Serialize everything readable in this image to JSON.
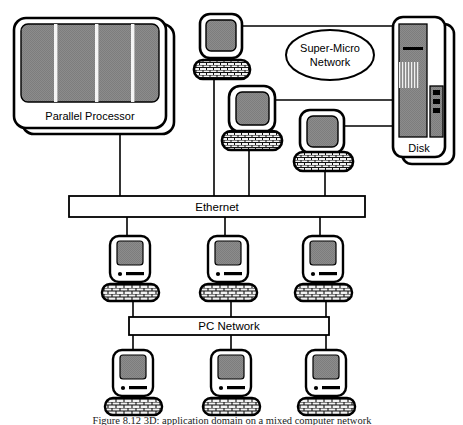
{
  "figure": {
    "caption": "Figure  8.12    3D:  application  domain  on  a  mixed  computer  network",
    "background_color": "#ffffff",
    "line_color": "#000000",
    "screen_fill": "#8c8c8c",
    "device_fill": "#ffffff",
    "keyboard_fill": "#e8e8e8"
  },
  "nodes": {
    "parallel_processor": {
      "label": "Parallel Processor",
      "type": "parallel-processor",
      "stripe_count": 3
    },
    "super_micro_network": {
      "label_line1": "Super-Micro",
      "label_line2": "Network",
      "type": "network-cloud-ellipse"
    },
    "disk": {
      "label": "Disk",
      "type": "disk-tower",
      "indicator_count": 3
    },
    "ethernet": {
      "label": "Ethernet",
      "type": "bus-bar",
      "uplinks": 4,
      "downlinks": 3
    },
    "pc_network": {
      "label": "PC Network",
      "type": "bus-bar",
      "uplinks": 3,
      "downlinks": 3
    }
  },
  "workstations": [
    {
      "name": "workstation-top",
      "type": "terminal"
    },
    {
      "name": "workstation-middle",
      "type": "terminal"
    },
    {
      "name": "workstation-lower",
      "type": "terminal"
    }
  ],
  "ethernet_clients": [
    {
      "name": "mac-ethernet-1",
      "type": "macintosh"
    },
    {
      "name": "mac-ethernet-2",
      "type": "macintosh"
    },
    {
      "name": "mac-ethernet-3",
      "type": "macintosh"
    }
  ],
  "pc_network_clients": [
    {
      "name": "mac-pcnet-1",
      "type": "macintosh"
    },
    {
      "name": "mac-pcnet-2",
      "type": "macintosh"
    },
    {
      "name": "mac-pcnet-3",
      "type": "macintosh"
    }
  ]
}
